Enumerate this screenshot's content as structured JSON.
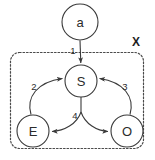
{
  "diagram": {
    "title": "",
    "boundary": {
      "label": "X",
      "style": "dashed-rounded-rectangle"
    },
    "nodes": [
      {
        "id": "a",
        "label": "a",
        "cx": 80,
        "cy": 22,
        "r": 18,
        "inside_boundary": false
      },
      {
        "id": "S",
        "label": "S",
        "cx": 81,
        "cy": 81,
        "r": 16,
        "inside_boundary": true
      },
      {
        "id": "E",
        "label": "E",
        "cx": 33,
        "cy": 131,
        "r": 16,
        "inside_boundary": true
      },
      {
        "id": "O",
        "label": "O",
        "cx": 127,
        "cy": 131,
        "r": 16,
        "inside_boundary": true
      }
    ],
    "edges": [
      {
        "id": "e1",
        "label": "1",
        "from": "a",
        "to": "S",
        "shape": "straight",
        "direction": "down"
      },
      {
        "id": "e2",
        "label": "2",
        "from": "E",
        "to": "S",
        "shape": "curve",
        "direction": "up-right"
      },
      {
        "id": "e3",
        "label": "3",
        "from": "O",
        "to": "S",
        "shape": "curve",
        "direction": "up-left"
      },
      {
        "id": "e4",
        "label": "4",
        "from": "S",
        "to": "E and O",
        "shape": "split-curve",
        "direction": "down-both"
      }
    ],
    "colors": {
      "stroke": "#3a3a3a",
      "text": "#2b2b2b",
      "background": "#ffffff",
      "boundary_stroke": "#4a4a4a"
    }
  }
}
